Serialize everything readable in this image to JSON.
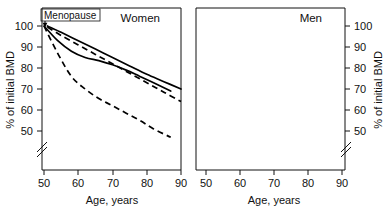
{
  "figure": {
    "background_color": "#ffffff",
    "line_color": "#000000"
  },
  "chart_data": {
    "type": "line",
    "title": "",
    "panels": [
      {
        "name": "women",
        "panel_label": "Women",
        "xlabel": "Age, years",
        "ylabel": "% of initial BMD",
        "xlim": [
          48,
          92
        ],
        "ylim": [
          44,
          104
        ],
        "xticks": [
          50,
          60,
          70,
          80,
          90
        ],
        "yticks": [
          50,
          60,
          70,
          80,
          90,
          100
        ],
        "grid": false,
        "axis_break": true,
        "annotation": {
          "text": "Menopause",
          "x": 50,
          "y": 100,
          "boxed": true,
          "arrow": "down"
        },
        "series": [
          {
            "name": "solid",
            "style": "solid",
            "x": [
              50,
              54,
              58,
              62,
              66,
              70,
              74,
              78,
              82,
              87
            ],
            "y": [
              100,
              93,
              88,
              85,
              83.5,
              81.5,
              79,
              76,
              73,
              69
            ]
          },
          {
            "name": "dashed",
            "style": "dashed",
            "x": [
              50,
              54,
              58,
              62,
              66,
              70,
              74,
              78,
              82,
              87
            ],
            "y": [
              100,
              87,
              76,
              70,
              65.5,
              62,
              58.5,
              55,
              51,
              47
            ]
          }
        ]
      },
      {
        "name": "men",
        "panel_label": "Men",
        "xlabel": "Age, years",
        "ylabel": "% of initial BMD",
        "xlim": [
          48,
          92
        ],
        "ylim": [
          44,
          104
        ],
        "xticks": [
          50,
          60,
          70,
          80,
          90
        ],
        "yticks": [
          50,
          60,
          70,
          80,
          90,
          100
        ],
        "grid": false,
        "axis_break": true,
        "series": [
          {
            "name": "solid",
            "style": "solid",
            "x": [
              51,
              55,
              60,
              65,
              70,
              75,
              80,
              85,
              90
            ],
            "y": [
              100,
              97,
              93,
              89,
              85,
              81,
              77,
              73.5,
              70
            ]
          },
          {
            "name": "dashed",
            "style": "dashed",
            "x": [
              51,
              55,
              60,
              65,
              70,
              75,
              80,
              85,
              90
            ],
            "y": [
              99.5,
              95.5,
              91,
              86.5,
              82,
              77.5,
              73,
              68.5,
              64
            ]
          }
        ]
      }
    ]
  },
  "left_panel": {
    "title": "Women",
    "annotation": "Menopause",
    "ylabel": "% of initial BMD",
    "xlabel": "Age, years",
    "yticks": {
      "t100": "100",
      "t90": "90",
      "t80": "80",
      "t70": "70",
      "t60": "60",
      "t50": "50"
    },
    "xticks": {
      "t50": "50",
      "t60": "60",
      "t70": "70",
      "t80": "80",
      "t90": "90"
    }
  },
  "right_panel": {
    "title": "Men",
    "ylabel": "% of initial BMD",
    "xlabel": "Age, years",
    "yticks": {
      "t100": "100",
      "t90": "90",
      "t80": "80",
      "t70": "70",
      "t60": "60",
      "t50": "50"
    },
    "xticks": {
      "t50": "50",
      "t60": "60",
      "t70": "70",
      "t80": "80",
      "t90": "90"
    }
  }
}
